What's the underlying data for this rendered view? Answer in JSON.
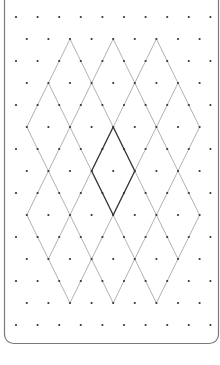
{
  "diagram": {
    "type": "isometric-dot-grid-with-diamond-lattice",
    "colors": {
      "background": "#ffffff",
      "border": "#7a7a7a",
      "dot": "#333333",
      "thin_line": "#a8a8a8",
      "bold_line": "#3a3a3a"
    },
    "frame": {
      "x": 4.5,
      "y": -8,
      "width": 214,
      "height": 351.5,
      "radius": 9
    },
    "grid": {
      "origin_x": 16,
      "origin_y": 17,
      "half_column_spacing": 10.8,
      "row_spacing": 22,
      "rows": 15,
      "half_columns": 19,
      "dot_radius": 1.1
    },
    "lattice": {
      "slash_lines": [
        {
          "k": 6,
          "r_from": 1,
          "r_to": 5
        },
        {
          "k": 10,
          "r_from": 1,
          "r_to": 9
        },
        {
          "k": 14,
          "r_from": 1,
          "r_to": 11
        },
        {
          "k": 18,
          "r_from": 3,
          "r_to": 13
        },
        {
          "k": 22,
          "r_from": 5,
          "r_to": 13
        },
        {
          "k": 26,
          "r_from": 9,
          "r_to": 13
        }
      ],
      "backslash_lines": [
        {
          "m": 12,
          "r_from": 1,
          "r_to": 5
        },
        {
          "m": 8,
          "r_from": 1,
          "r_to": 9
        },
        {
          "m": 4,
          "r_from": 1,
          "r_to": 11
        },
        {
          "m": 0,
          "r_from": 3,
          "r_to": 13
        },
        {
          "m": -4,
          "r_from": 5,
          "r_to": 13
        },
        {
          "m": -8,
          "r_from": 9,
          "r_to": 13
        }
      ],
      "highlighted_diamond": [
        [
          9,
          5
        ],
        [
          11,
          7
        ],
        [
          9,
          9
        ],
        [
          7,
          7
        ]
      ]
    }
  }
}
